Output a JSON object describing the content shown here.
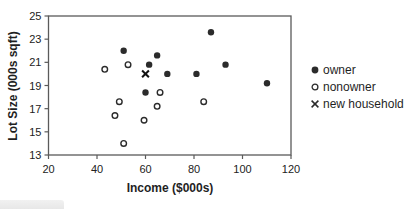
{
  "chart_data": {
    "type": "scatter",
    "title": "",
    "xlabel": "Income ($000s)",
    "ylabel": "Lot Size (000s sqft)",
    "xlim": [
      20,
      120
    ],
    "ylim": [
      13,
      25
    ],
    "xticks": [
      20,
      40,
      60,
      80,
      100,
      120
    ],
    "yticks": [
      13,
      15,
      17,
      19,
      21,
      23,
      25
    ],
    "grid": false,
    "plot_border": "box",
    "legend_position": "right",
    "series": [
      {
        "name": "owner",
        "marker": "filled-circle-icon",
        "points": [
          [
            51,
            22
          ],
          [
            60,
            18.4
          ],
          [
            61.5,
            20.8
          ],
          [
            64.8,
            21.6
          ],
          [
            69,
            20
          ],
          [
            81,
            20
          ],
          [
            87,
            23.6
          ],
          [
            93,
            20.8
          ],
          [
            110.1,
            19.2
          ]
        ]
      },
      {
        "name": "nonowner",
        "marker": "open-circle-icon",
        "points": [
          [
            43.2,
            20.4
          ],
          [
            47.4,
            16.4
          ],
          [
            49.2,
            17.6
          ],
          [
            51,
            14
          ],
          [
            52.8,
            20.8
          ],
          [
            59.4,
            16
          ],
          [
            64.8,
            17.2
          ],
          [
            66,
            18.4
          ],
          [
            84,
            17.6
          ]
        ]
      },
      {
        "name": "new household",
        "marker": "x-cross-icon",
        "points": [
          [
            60,
            20
          ]
        ]
      }
    ],
    "colors": {
      "marker": "#2b2b2b",
      "axis": "#5a5a5a",
      "text": "#1f1f1f",
      "background": "#ffffff"
    }
  }
}
